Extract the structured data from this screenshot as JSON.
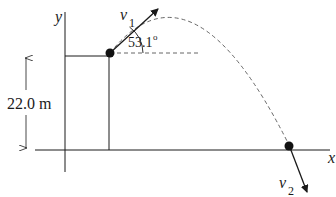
{
  "diagram": {
    "type": "projectile-motion",
    "axes": {
      "x_label": "x",
      "y_label": "y"
    },
    "height_dimension": {
      "label": "22.0 m"
    },
    "launch": {
      "velocity_label": "v",
      "velocity_subscript": "1",
      "angle_label": "53.1",
      "angle_unit": "o"
    },
    "landing": {
      "velocity_label": "v",
      "velocity_subscript": "2"
    },
    "colors": {
      "stroke": "#1a1a1a",
      "dashed": "#555555"
    }
  }
}
